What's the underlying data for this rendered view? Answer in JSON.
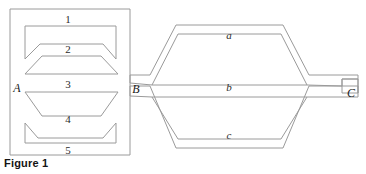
{
  "figure": {
    "caption": "Figure 1",
    "nodes": [
      {
        "id": "A",
        "label": "A",
        "x": 16,
        "y": 88
      },
      {
        "id": "B",
        "label": "B",
        "x": 135,
        "y": 89
      },
      {
        "id": "C",
        "label": "C",
        "x": 351,
        "y": 95
      }
    ],
    "left_segments": [
      {
        "label": "1",
        "x": 68,
        "y": 19
      },
      {
        "label": "2",
        "x": 68,
        "y": 49
      },
      {
        "label": "3",
        "x": 68,
        "y": 84
      },
      {
        "label": "4",
        "x": 68,
        "y": 119
      },
      {
        "label": "5",
        "x": 68,
        "y": 150
      }
    ],
    "right_branches": [
      {
        "label": "a",
        "x": 229,
        "y": 36
      },
      {
        "label": "b",
        "x": 229,
        "y": 88
      },
      {
        "label": "c",
        "x": 229,
        "y": 136
      }
    ],
    "outline_paths": {
      "left_box": "M 10 9 L 130 9 L 130 155 L 10 155 Z",
      "channel_1": "M 25 26 L 116 26 L 116 59 L 103 44 L 40 44 L 25 59 Z",
      "channel_2": "M 25 72 L 40 57 L 103 57 L 116 72 Z",
      "channel_3": "M 25 90 L 116 90 L 103 116 L 40 116 Z",
      "channel_4": "M 25 123 L 40 137 L 103 137 L 116 123 L 116 143 L 25 143 Z",
      "right_net": "M 130 76 L 150 76 L 175 26 L 283 26 L 308 76 L 358 76 L 358 93 L 342 93 L 342 79 L 308 79 L 308 83 L 283 30 L 175 30 L 150 83 L 130 83 Z",
      "right_mid": "M 152 86 L 177 35 L 281 35 L 306 86 Z",
      "right_lower_outer": "M 130 86 L 150 86 L 175 147 L 283 147 L 308 86 L 342 86 L 342 97 L 358 97 L 358 100 L 306 100 L 281 151 L 177 151 L 152 100 L 130 100 Z",
      "right_lower_inner": "M 152 96 L 177 140 L 281 140 L 306 96 Z"
    }
  }
}
